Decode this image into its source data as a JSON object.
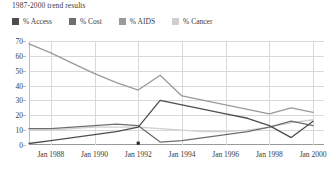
{
  "chart_data": {
    "type": "line",
    "title": "1987-2000 trend results",
    "xlabel": "",
    "ylabel": "",
    "ylim": [
      0,
      70
    ],
    "yticks": [
      0,
      10,
      20,
      30,
      40,
      50,
      60,
      70
    ],
    "xticks": [
      "Jan 1988",
      "Jan 1990",
      "Jan 1992",
      "Jan 1994",
      "Jan 1996",
      "Jan 1998",
      "Jan 2000"
    ],
    "xlim": [
      1987,
      2000.5
    ],
    "grid": true,
    "legend_position": "top-left",
    "x": [
      1987,
      1988,
      1989,
      1990,
      1991,
      1992,
      1993,
      1994,
      1995,
      1996,
      1997,
      1998,
      1999,
      2000
    ],
    "series": [
      {
        "name": "% Access",
        "color": "#4d4d4d",
        "values": [
          1,
          3,
          5,
          7,
          9,
          12,
          30,
          27,
          24,
          21,
          18,
          13,
          5,
          16
        ]
      },
      {
        "name": "% Cost",
        "color": "#6e6e6e",
        "values": [
          11,
          11,
          12,
          13,
          14,
          13,
          2,
          3,
          5,
          7,
          9,
          12,
          16,
          13
        ]
      },
      {
        "name": "% AIDS",
        "color": "#9a9a9a",
        "values": [
          68,
          62,
          55,
          48,
          42,
          37,
          47,
          33,
          30,
          27,
          24,
          21,
          25,
          22
        ]
      },
      {
        "name": "% Cancer",
        "color": "#cfcfcf",
        "values": [
          10,
          10,
          11,
          12,
          12,
          12,
          11,
          10,
          9,
          9,
          10,
          12,
          15,
          17
        ]
      }
    ],
    "markers": [
      {
        "series": "% Access",
        "x": 1992,
        "y": 0,
        "color": "#2b2b2b"
      }
    ]
  }
}
